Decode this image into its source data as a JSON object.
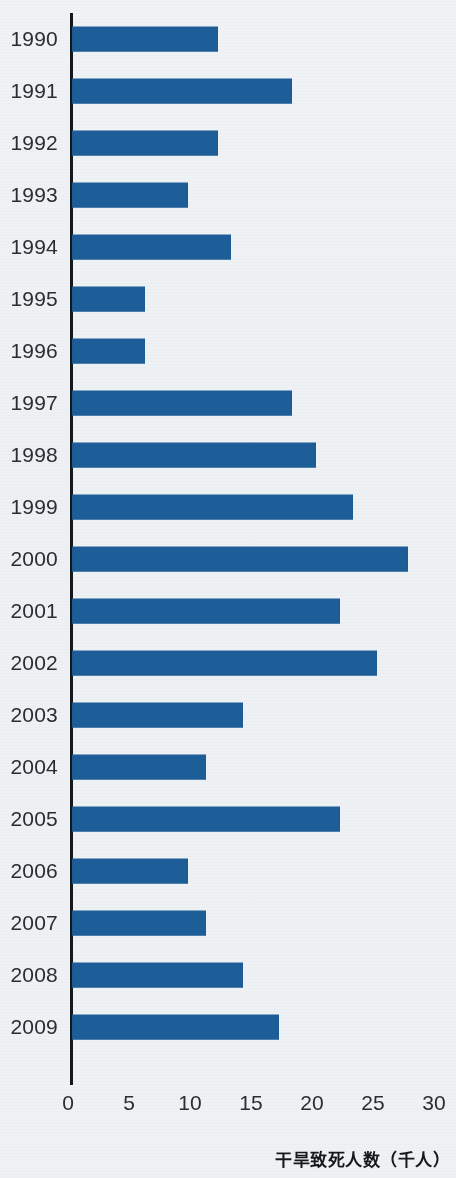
{
  "chart_data": {
    "type": "bar",
    "orientation": "horizontal",
    "title": "",
    "subtitle": "",
    "xlabel": "干旱致死人数（千人）",
    "ylabel": "",
    "categories": [
      "1990",
      "1991",
      "1992",
      "1993",
      "1994",
      "1995",
      "1996",
      "1997",
      "1998",
      "1999",
      "2000",
      "2001",
      "2002",
      "2003",
      "2004",
      "2005",
      "2006",
      "2007",
      "2008",
      "2009"
    ],
    "values": [
      12,
      18,
      12,
      9.5,
      13,
      6,
      6,
      18,
      20,
      23,
      27.5,
      22,
      25,
      14,
      11,
      22,
      9.5,
      11,
      14,
      17
    ],
    "series": [
      {
        "name": "干旱致死人数（千人）",
        "values": [
          12,
          18,
          12,
          9.5,
          13,
          6,
          6,
          18,
          20,
          23,
          27.5,
          22,
          25,
          14,
          11,
          22,
          9.5,
          11,
          14,
          17
        ]
      }
    ],
    "xlim": [
      0,
      30
    ],
    "xticks": [
      0,
      5,
      10,
      15,
      20,
      25,
      30
    ],
    "xtick_labels": [
      "0",
      "5",
      "10",
      "15",
      "20",
      "25",
      "30"
    ],
    "grid": false,
    "legend": "none",
    "bar_color": "#1d5e99",
    "axis_color": "#15171a",
    "background_color": "#eef2f5",
    "text_color": "#2a2d31"
  },
  "axis": {
    "caption": "干旱致死人数（千人）"
  }
}
